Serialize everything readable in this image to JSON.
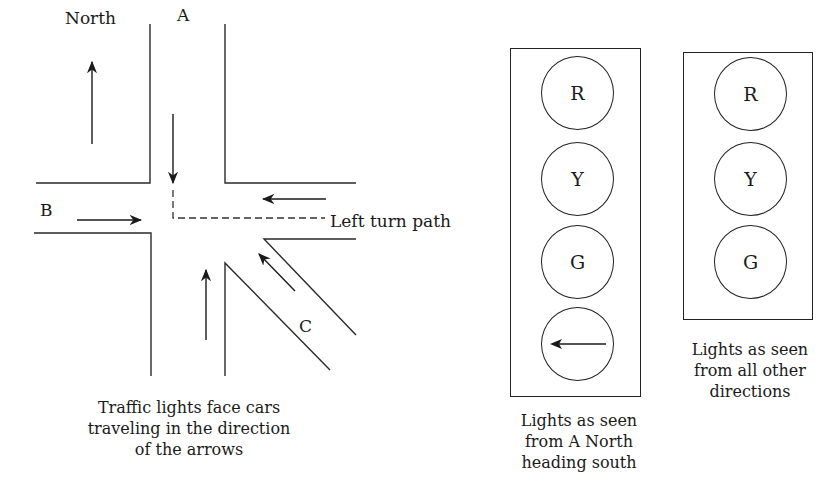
{
  "intersection": {
    "compass_label": "North",
    "road_labels": {
      "a": "A",
      "b": "B",
      "c": "C"
    },
    "left_turn_label": "Left turn path",
    "caption": [
      "Traffic lights face cars",
      "traveling in the direction",
      "of the arrows"
    ]
  },
  "signal_a": {
    "lamps": [
      "R",
      "Y",
      "G",
      "left-arrow"
    ],
    "caption": [
      "Lights as seen",
      "from A North",
      "heading south"
    ]
  },
  "signal_other": {
    "lamps": [
      "R",
      "Y",
      "G"
    ],
    "caption": [
      "Lights as seen",
      "from all other",
      "directions"
    ]
  }
}
